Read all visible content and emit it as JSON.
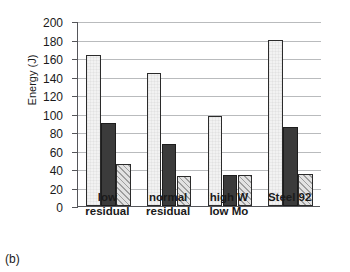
{
  "figure": {
    "caption": "(b)"
  },
  "chart_data": {
    "type": "bar",
    "title": "",
    "xlabel": "",
    "ylabel": "Energy (J)",
    "ylim": [
      0,
      200
    ],
    "ytick_step": 20,
    "yticks": [
      0,
      20,
      40,
      60,
      80,
      100,
      120,
      140,
      160,
      180,
      200
    ],
    "ytick_labels": [
      "0",
      "20",
      "40",
      "60",
      "80",
      "100",
      "120",
      "140",
      "160",
      "180",
      "200"
    ],
    "grid": true,
    "legend": "none",
    "categories": [
      "low residual",
      "normal residual",
      "high W low Mo",
      "Steel 92"
    ],
    "category_lines": [
      [
        "low",
        "residual"
      ],
      [
        "normal",
        "residual"
      ],
      [
        "high W",
        "low Mo"
      ],
      [
        "Steel 92",
        ""
      ]
    ],
    "series": [
      {
        "name": "series-1",
        "style": "white",
        "values": [
          163,
          144,
          97,
          180
        ]
      },
      {
        "name": "series-2",
        "style": "dark",
        "values": [
          90,
          67,
          33,
          85
        ]
      },
      {
        "name": "series-3",
        "style": "hatched",
        "values": [
          45,
          32,
          33,
          35
        ]
      }
    ],
    "colors": {
      "series1_fill": "#f2f2f2",
      "series2_fill": "#3b3b3b",
      "series3_fill": "#e2e2e2",
      "bar_edge": "#2b2b2b",
      "axis": "#55565a",
      "gridline": "#b9bbbd"
    }
  }
}
